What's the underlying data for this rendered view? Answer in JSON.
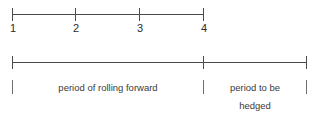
{
  "diagram": {
    "type": "timeline",
    "title": "",
    "colors": {
      "line": "#4a4a4a",
      "tick_soft": "#6e6e6e",
      "number_text": "#2b2b2b",
      "caption_text": "#3a3a3a",
      "background": "#ffffff"
    },
    "top_axis": {
      "name": "period-axis",
      "start_px": 12,
      "end_px": 203,
      "ticks": [
        {
          "label": "1",
          "x_px": 12
        },
        {
          "label": "2",
          "x_px": 75
        },
        {
          "label": "3",
          "x_px": 139
        },
        {
          "label": "4",
          "x_px": 203
        }
      ]
    },
    "bottom_axis": {
      "name": "segment-axis",
      "start_px": 12,
      "end_px": 306,
      "divider_px": 203,
      "ticks": [
        {
          "x_px": 12
        },
        {
          "x_px": 203
        },
        {
          "x_px": 306
        }
      ]
    },
    "segments": [
      {
        "name": "rolling-forward",
        "label": "period of rolling forward",
        "from_px": 12,
        "to_px": 203
      },
      {
        "name": "to-be-hedged",
        "label_line_1": "period to be",
        "label_line_2": "hedged",
        "from_px": 203,
        "to_px": 306
      }
    ]
  }
}
